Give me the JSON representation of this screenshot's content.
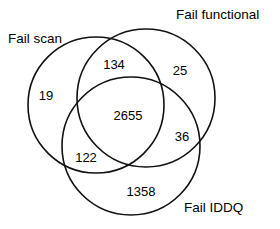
{
  "figure": {
    "type": "venn-diagram",
    "background_color": "#ffffff",
    "stroke_color": "#111111",
    "text_color": "#000000"
  },
  "chart_data": {
    "type": "venn",
    "title": "",
    "xlabel": "",
    "ylabel": "",
    "sets": [
      {
        "key": "fail_scan",
        "label": "Fail scan"
      },
      {
        "key": "fail_functional",
        "label": "Fail functional"
      },
      {
        "key": "fail_iddq",
        "label": "Fail IDDQ"
      }
    ],
    "regions": [
      {
        "key": "scan_only",
        "sets": [
          "fail_scan"
        ],
        "value": 19
      },
      {
        "key": "scan_functional",
        "sets": [
          "fail_scan",
          "fail_functional"
        ],
        "value": 134
      },
      {
        "key": "functional_only",
        "sets": [
          "fail_functional"
        ],
        "value": 25
      },
      {
        "key": "all_three",
        "sets": [
          "fail_scan",
          "fail_functional",
          "fail_iddq"
        ],
        "value": 2655
      },
      {
        "key": "functional_iddq",
        "sets": [
          "fail_functional",
          "fail_iddq"
        ],
        "value": 36
      },
      {
        "key": "scan_iddq",
        "sets": [
          "fail_scan",
          "fail_iddq"
        ],
        "value": 122
      },
      {
        "key": "iddq_only",
        "sets": [
          "fail_iddq"
        ],
        "value": 1358
      }
    ],
    "counts": {
      "scan_only": "19",
      "scan_functional": "134",
      "functional_only": "25",
      "all_three": "2655",
      "functional_iddq": "36",
      "scan_iddq": "122",
      "iddq_only": "1358"
    },
    "labels": {
      "fail_scan": "Fail scan",
      "fail_functional": "Fail functional",
      "fail_iddq": "Fail IDDQ"
    },
    "legend": "none",
    "grid": false
  },
  "geometry": {
    "circles": [
      {
        "key": "fail_scan",
        "cx": 96,
        "cy": 105,
        "r": 68
      },
      {
        "key": "fail_functional",
        "cx": 146,
        "cy": 98,
        "r": 69
      },
      {
        "key": "fail_iddq",
        "cx": 131,
        "cy": 146,
        "r": 69
      }
    ]
  }
}
